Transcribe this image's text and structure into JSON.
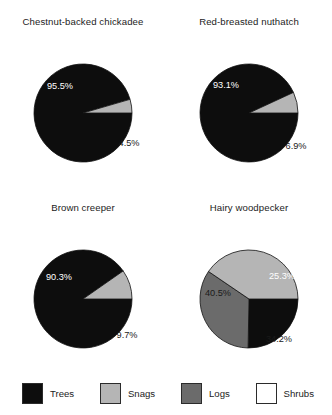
{
  "chart_data": {
    "type": "pie",
    "title": "",
    "legend_position": "bottom",
    "legend": [
      "Trees",
      "Snags",
      "Logs",
      "Shrubs"
    ],
    "colors": {
      "Trees": "#0d0d0d",
      "Snags": "#b5b5b5",
      "Logs": "#6b6b6b",
      "Shrubs": "#ffffff"
    },
    "charts": [
      {
        "title": "Chestnut-backed chickadee",
        "categories": [
          "Trees",
          "Snags"
        ],
        "values": [
          95.5,
          4.5
        ],
        "labels": [
          "95.5%",
          "4.5%"
        ],
        "label_colors": [
          "#ffffff",
          "#1a1a1a"
        ],
        "label_pos": [
          {
            "x": 60,
            "y": 57
          },
          {
            "x": 129,
            "y": 114
          }
        ],
        "start_angle_deg": 0,
        "direction": "clockwise"
      },
      {
        "title": "Red-breasted nuthatch",
        "categories": [
          "Trees",
          "Snags"
        ],
        "values": [
          93.1,
          6.9
        ],
        "labels": [
          "93.1%",
          "6.9%"
        ],
        "label_colors": [
          "#ffffff",
          "#1a1a1a"
        ],
        "label_pos": [
          {
            "x": 60,
            "y": 56
          },
          {
            "x": 130,
            "y": 117
          }
        ],
        "start_angle_deg": 0,
        "direction": "clockwise"
      },
      {
        "title": "Brown creeper",
        "categories": [
          "Trees",
          "Snags"
        ],
        "values": [
          90.3,
          9.7
        ],
        "labels": [
          "90.3%",
          "9.7%"
        ],
        "label_colors": [
          "#ffffff",
          "#1a1a1a"
        ],
        "label_pos": [
          {
            "x": 59,
            "y": 62
          },
          {
            "x": 127,
            "y": 120
          }
        ],
        "start_angle_deg": 0,
        "direction": "clockwise"
      },
      {
        "title": "Hairy woodpecker",
        "categories": [
          "Trees",
          "Logs",
          "Snags"
        ],
        "values": [
          25.3,
          34.2,
          40.5
        ],
        "labels": [
          "25.3%",
          "34.2%",
          "40.5%"
        ],
        "label_colors": [
          "#ffffff",
          "#1a1a1a",
          "#1a1a1a"
        ],
        "label_pos": [
          {
            "x": 116,
            "y": 61
          },
          {
            "x": 113,
            "y": 124
          },
          {
            "x": 52,
            "y": 78
          }
        ],
        "start_angle_deg": 0,
        "direction": "clockwise"
      }
    ],
    "geometry": {
      "cx": 83,
      "cy": 83,
      "r": 49,
      "viewbox": "0 0 166 166"
    }
  },
  "legend": {
    "items": [
      {
        "label": "Trees",
        "color": "#0d0d0d"
      },
      {
        "label": "Snags",
        "color": "#b5b5b5"
      },
      {
        "label": "Logs",
        "color": "#6b6b6b"
      },
      {
        "label": "Shrubs",
        "color": "#ffffff"
      }
    ]
  }
}
